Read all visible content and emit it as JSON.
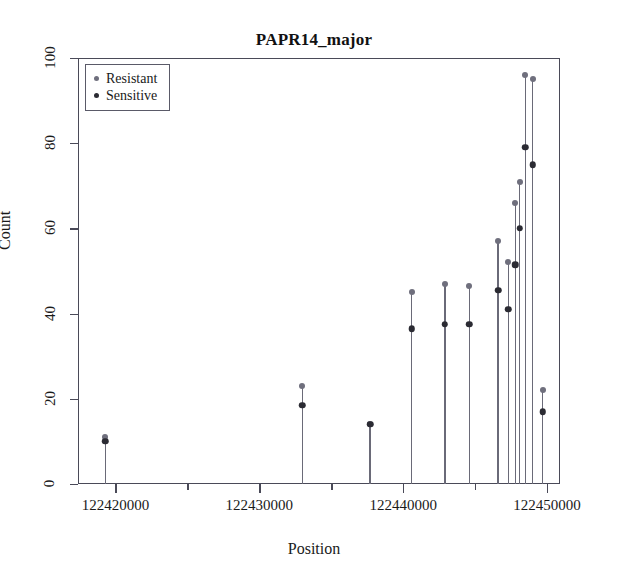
{
  "chart_data": {
    "type": "scatter",
    "title": "PAPR14_major",
    "xlabel": "Position",
    "ylabel": "Count",
    "xlim": [
      122417400,
      122450900
    ],
    "ylim": [
      0,
      100
    ],
    "grid": false,
    "legend_position": "top-left",
    "x_ticks": [
      {
        "value": 122420000,
        "label": "122420000",
        "type": "major"
      },
      {
        "value": 122425000,
        "label": "",
        "type": "minor"
      },
      {
        "value": 122430000,
        "label": "122430000",
        "type": "major"
      },
      {
        "value": 122435000,
        "label": "",
        "type": "minor"
      },
      {
        "value": 122440000,
        "label": "122440000",
        "type": "major"
      },
      {
        "value": 122445000,
        "label": "",
        "type": "minor"
      },
      {
        "value": 122450000,
        "label": "122450000",
        "type": "major"
      }
    ],
    "y_ticks": [
      {
        "value": 0,
        "label": "0"
      },
      {
        "value": 20,
        "label": "20"
      },
      {
        "value": 40,
        "label": "40"
      },
      {
        "value": 60,
        "label": "60"
      },
      {
        "value": 80,
        "label": "80"
      },
      {
        "value": 100,
        "label": "100"
      }
    ],
    "legend": [
      {
        "name": "Resistant",
        "color": "#6f6f7d"
      },
      {
        "name": "Sensitive",
        "color": "#2b2b33"
      }
    ],
    "series": [
      {
        "name": "Resistant",
        "color": "#6f6f7d",
        "points": [
          {
            "x": 122419300,
            "y": 11
          },
          {
            "x": 122433000,
            "y": 23
          },
          {
            "x": 122437700,
            "y": 14
          },
          {
            "x": 122440600,
            "y": 45
          },
          {
            "x": 122442900,
            "y": 47
          },
          {
            "x": 122444600,
            "y": 46.5
          },
          {
            "x": 122446600,
            "y": 57
          },
          {
            "x": 122447300,
            "y": 52
          },
          {
            "x": 122447800,
            "y": 66
          },
          {
            "x": 122448100,
            "y": 71
          },
          {
            "x": 122448500,
            "y": 96
          },
          {
            "x": 122449000,
            "y": 95
          },
          {
            "x": 122449700,
            "y": 22
          }
        ]
      },
      {
        "name": "Sensitive",
        "color": "#2b2b33",
        "points": [
          {
            "x": 122419300,
            "y": 10
          },
          {
            "x": 122433000,
            "y": 18.5
          },
          {
            "x": 122437700,
            "y": 14
          },
          {
            "x": 122440600,
            "y": 36.5
          },
          {
            "x": 122442900,
            "y": 37.5
          },
          {
            "x": 122444600,
            "y": 37.5
          },
          {
            "x": 122446600,
            "y": 45.5
          },
          {
            "x": 122447300,
            "y": 41
          },
          {
            "x": 122447800,
            "y": 51.5
          },
          {
            "x": 122448100,
            "y": 60
          },
          {
            "x": 122448500,
            "y": 79
          },
          {
            "x": 122449000,
            "y": 75
          },
          {
            "x": 122449700,
            "y": 17
          }
        ]
      }
    ],
    "stems": [
      {
        "x": 122419300,
        "top": 11
      },
      {
        "x": 122433000,
        "top": 23
      },
      {
        "x": 122437700,
        "top": 14
      },
      {
        "x": 122440600,
        "top": 45
      },
      {
        "x": 122442900,
        "top": 47
      },
      {
        "x": 122444600,
        "top": 46.5
      },
      {
        "x": 122446600,
        "top": 57
      },
      {
        "x": 122447300,
        "top": 52
      },
      {
        "x": 122447800,
        "top": 66
      },
      {
        "x": 122448100,
        "top": 71
      },
      {
        "x": 122448500,
        "top": 96
      },
      {
        "x": 122449000,
        "top": 95
      },
      {
        "x": 122449700,
        "top": 22
      }
    ]
  }
}
